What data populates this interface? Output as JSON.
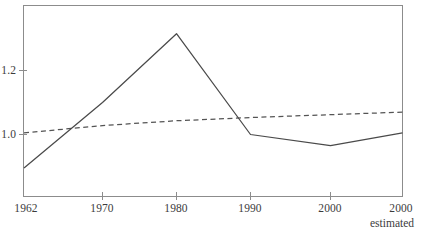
{
  "chart_data": {
    "type": "line",
    "title": "",
    "subtitle": "",
    "xlabel": "",
    "ylabel": "",
    "grid": false,
    "legend_position": "none",
    "x": [
      "1962",
      "1970",
      "1980",
      "1990",
      "2000",
      "2000"
    ],
    "categories": [
      "1962",
      "1970",
      "1980",
      "1990",
      "2000",
      "2000"
    ],
    "x_tick_labels": [
      "1962",
      "1970",
      "1980",
      "1990",
      "2000",
      "2000"
    ],
    "x_tick_note": "estimated",
    "y_tick_labels": [
      "1.2",
      "1.0"
    ],
    "y_tick_values": [
      1.2,
      1.0
    ],
    "ylim": [
      0.84,
      1.37
    ],
    "xlim": [
      1962,
      2005
    ],
    "series": [
      {
        "name": "solid-series",
        "style": "solid",
        "color": "#4a4a4a",
        "values": [
          0.895,
          1.1,
          1.315,
          1.0,
          0.965,
          1.005
        ]
      },
      {
        "name": "dashed-series",
        "style": "dashed",
        "color": "#545454",
        "values": [
          1.005,
          1.028,
          1.043,
          1.053,
          1.062,
          1.07
        ]
      }
    ]
  },
  "axes": {
    "frame_color": "#8c8c8c",
    "tick_color": "#8c8c8c"
  },
  "labels": {
    "x": [
      {
        "text": "1962"
      },
      {
        "text": "1970"
      },
      {
        "text": "1980"
      },
      {
        "text": "1990"
      },
      {
        "text": "2000"
      },
      {
        "text": "2000"
      }
    ],
    "note": "estimated",
    "y": [
      {
        "text": "1.2"
      },
      {
        "text": "1.0"
      }
    ]
  }
}
